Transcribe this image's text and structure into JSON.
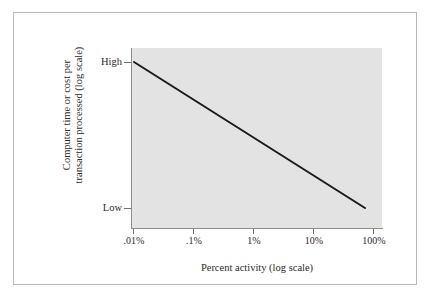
{
  "figure": {
    "background_color": "#ffffff",
    "frame_color": "#b9b9b9",
    "panel_color": "#e3e3e3",
    "line_color": "#1a1a1a"
  },
  "chart_data": {
    "type": "line",
    "title": "",
    "xlabel": "Percent activity (log scale)",
    "ylabel_line1": "Computer time or cost per",
    "ylabel_line2": "transaction processed (log scale)",
    "x_tick_labels": [
      ".01%",
      ".1%",
      "1%",
      "10%",
      "100%"
    ],
    "x_tick_values": [
      0.01,
      0.1,
      1,
      10,
      100
    ],
    "y_tick_labels": [
      "High",
      "Low"
    ],
    "y_tick_values": [
      1,
      0
    ],
    "xscale": "log",
    "yscale": "log",
    "grid": false,
    "legend": "none",
    "series": [
      {
        "name": "Unit cost per transaction",
        "x": [
          0.01,
          100
        ],
        "y": [
          1,
          0
        ],
        "points_px": [
          [
            134,
            62
          ],
          [
            365,
            208
          ]
        ],
        "style": "solid",
        "color": "#1a1a1a",
        "width_px": 2
      }
    ],
    "annotations": []
  }
}
